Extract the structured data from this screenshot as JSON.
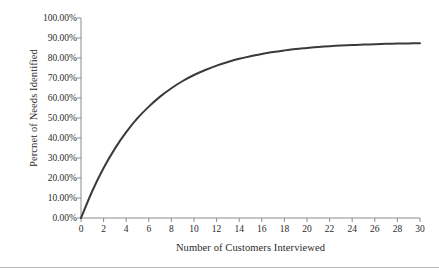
{
  "chart_data": {
    "type": "line",
    "title": "",
    "subtitle": "",
    "xlabel": "Number of Customers Interviewed",
    "ylabel": "Percnet of Needs Identified",
    "xlim": [
      0,
      30
    ],
    "ylim": [
      0,
      100
    ],
    "grid": false,
    "legend": null,
    "legend_position": "none",
    "line_color": "#3a3a3a",
    "line_width": 2,
    "markers": false,
    "annotations": [],
    "xticks": [
      0,
      2,
      4,
      6,
      8,
      10,
      12,
      14,
      16,
      18,
      20,
      22,
      24,
      26,
      28,
      30
    ],
    "xticklabels": [
      "0",
      "2",
      "4",
      "6",
      "8",
      "10",
      "12",
      "14",
      "16",
      "18",
      "20",
      "22",
      "24",
      "26",
      "28",
      "30"
    ],
    "yticks": [
      0,
      10,
      20,
      30,
      40,
      50,
      60,
      70,
      80,
      90,
      100
    ],
    "yticklabels": [
      "0.00%",
      "10.00%",
      "20.00%",
      "30.00%",
      "40.00%",
      "50.00%",
      "60.00%",
      "70.00%",
      "80.00%",
      "90.00%",
      "100.00%"
    ],
    "series": [
      {
        "name": "Percent of needs identified",
        "x": [
          0,
          1,
          2,
          3,
          4,
          5,
          6,
          7,
          8,
          9,
          10,
          11,
          12,
          13,
          14,
          15,
          16,
          17,
          18,
          19,
          20,
          21,
          22,
          23,
          24,
          25,
          26,
          27,
          28,
          29,
          30
        ],
        "values": [
          0.0,
          13.5,
          25.0,
          34.7,
          42.9,
          49.9,
          55.7,
          60.7,
          64.9,
          68.5,
          71.5,
          74.0,
          76.2,
          78.0,
          79.6,
          80.9,
          82.0,
          83.0,
          83.8,
          84.5,
          85.0,
          85.5,
          85.9,
          86.2,
          86.5,
          86.7,
          86.9,
          87.1,
          87.2,
          87.3,
          87.4
        ]
      }
    ]
  }
}
